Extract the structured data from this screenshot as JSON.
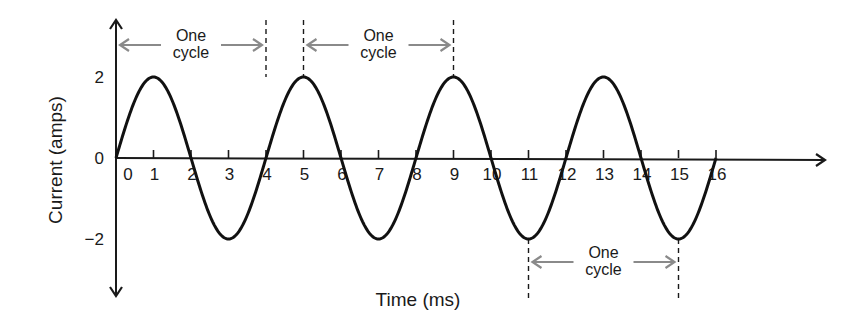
{
  "chart_data": {
    "type": "line",
    "title": "",
    "xlabel": "Time (ms)",
    "ylabel": "Current (amps)",
    "xlim": [
      0,
      16
    ],
    "ylim": [
      -2,
      2
    ],
    "x_ticks": [
      0,
      1,
      2,
      3,
      4,
      5,
      6,
      7,
      8,
      9,
      10,
      11,
      12,
      13,
      14,
      15,
      16
    ],
    "x_tick_labels": [
      "0",
      "1",
      "2",
      "3",
      "4",
      "5",
      "6",
      "7",
      "8",
      "9",
      "10",
      "11",
      "12",
      "13",
      "14",
      "15",
      "16"
    ],
    "y_ticks": [
      2,
      0,
      -2
    ],
    "y_tick_labels": [
      "2",
      "0",
      "−2"
    ],
    "grid": false,
    "series": [
      {
        "name": "Current",
        "function": "2*sin(2*pi*t/4)",
        "amplitude": 2,
        "period": 4,
        "x": [
          0,
          0.5,
          1,
          1.5,
          2,
          2.5,
          3,
          3.5,
          4,
          4.5,
          5,
          5.5,
          6,
          6.5,
          7,
          7.5,
          8,
          8.5,
          9,
          9.5,
          10,
          10.5,
          11,
          11.5,
          12,
          12.5,
          13,
          13.5,
          14,
          14.5,
          15,
          15.5,
          16
        ],
        "y": [
          0,
          1.41,
          2,
          1.41,
          0,
          -1.41,
          -2,
          -1.41,
          0,
          1.41,
          2,
          1.41,
          0,
          -1.41,
          -2,
          -1.41,
          0,
          1.41,
          2,
          1.41,
          0,
          -1.41,
          -2,
          -1.41,
          0,
          1.41,
          2,
          1.41,
          0,
          -1.41,
          -2,
          -1.41,
          0
        ]
      }
    ],
    "annotations": [
      {
        "label_line1": "One",
        "label_line2": "cycle",
        "from_x": 0,
        "to_x": 4,
        "position": "top",
        "dashed_markers": [
          4
        ]
      },
      {
        "label_line1": "One",
        "label_line2": "cycle",
        "from_x": 5,
        "to_x": 9,
        "position": "top",
        "dashed_markers": [
          5,
          9
        ]
      },
      {
        "label_line1": "One",
        "label_line2": "cycle",
        "from_x": 11,
        "to_x": 15,
        "position": "bottom",
        "dashed_markers": [
          11,
          15
        ]
      }
    ],
    "colors": {
      "curve": "#111111",
      "axis": "#1a1a1a",
      "annotation_arrow": "#8a8a8a"
    }
  }
}
